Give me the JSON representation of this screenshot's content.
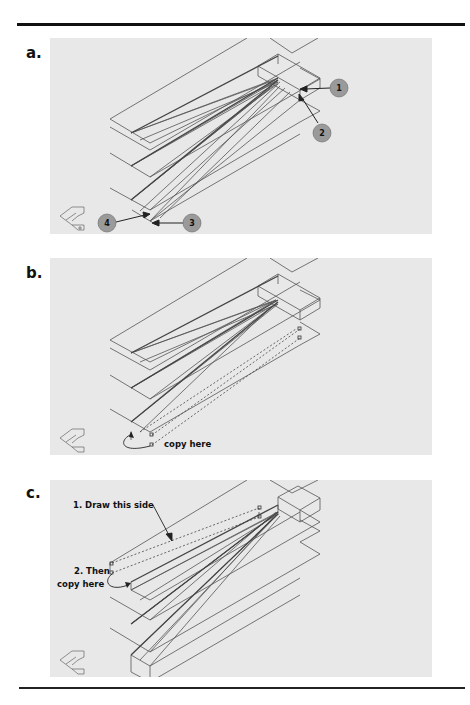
{
  "figure": {
    "panels": [
      {
        "id": "a",
        "label": "a.",
        "callouts": [
          {
            "number": "1"
          },
          {
            "number": "2"
          },
          {
            "number": "3"
          },
          {
            "number": "4"
          }
        ]
      },
      {
        "id": "b",
        "label": "b.",
        "annotation": "copy here"
      },
      {
        "id": "c",
        "label": "c.",
        "annotation_1": "1. Draw this side",
        "annotation_2_line1": "2. Then",
        "annotation_2_line2": "copy here"
      }
    ],
    "icons": {
      "ucs": "ucs-icon"
    },
    "colors": {
      "panel_bg": "#e8e8e8",
      "line": "#555555",
      "bubble": "#9a9a9a",
      "rule": "#111111"
    }
  }
}
